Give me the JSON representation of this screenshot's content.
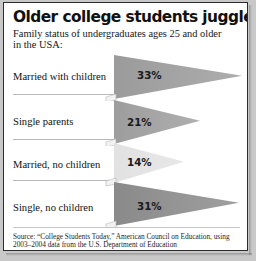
{
  "header": {
    "title": "Older college students juggle family",
    "subtitle": "Family status of undergraduates ages 25 and older in the USA:"
  },
  "footer": {
    "source": "Source: “College Students Today,” American Council on Education, using 2003–2004 data from the U.S. Department of Education"
  },
  "chart_data": {
    "type": "bar",
    "title": "Older college students juggle family",
    "subtitle": "Family status of undergraduates ages 25 and older in the USA:",
    "xlabel": "",
    "ylabel": "",
    "categories": [
      "Married with children",
      "Single parents",
      "Married, no children",
      "Single, no children"
    ],
    "values": [
      33,
      21,
      14,
      31
    ],
    "value_labels": [
      "33%",
      "21%",
      "14%",
      "31%"
    ],
    "unit": "%",
    "xlim": [
      0,
      35
    ],
    "grid": false,
    "legend": "none",
    "orientation": "horizontal",
    "marker_shape": "right-pointing-triangle-wedge",
    "colors": [
      "#9b9b9b",
      "#9d9d9d",
      "#e2e2e2",
      "#8a8a8a"
    ]
  },
  "bars": [
    {
      "label": "Married with children",
      "value_label": "33%",
      "color": "#9b9b9b",
      "tip_x": 238,
      "base_top": 0,
      "base_bottom": 44,
      "pct_x": 133,
      "pct_y": 14,
      "row_top": 0,
      "label_y": 16,
      "rule_y": 39
    },
    {
      "label": "Single parents",
      "value_label": "21%",
      "color": "#9d9d9d",
      "tip_x": 196,
      "base_top": 0,
      "base_bottom": 44,
      "pct_x": 123,
      "pct_y": 16,
      "row_top": 45,
      "label_y": 16,
      "rule_y": 39
    },
    {
      "label": "Married, no children",
      "value_label": "14%",
      "color": "#e2e2e2",
      "tip_x": 180,
      "base_top": 0,
      "base_bottom": 40,
      "pct_x": 123,
      "pct_y": 13,
      "row_top": 88,
      "label_y": 16,
      "rule_y": 37
    },
    {
      "label": "Single, no children",
      "value_label": "31%",
      "color": "#8a8a8a",
      "tip_x": 235,
      "base_top": 0,
      "base_bottom": 44,
      "pct_x": 133,
      "pct_y": 18,
      "row_top": 127,
      "label_y": 20,
      "rule_y": 0
    }
  ]
}
